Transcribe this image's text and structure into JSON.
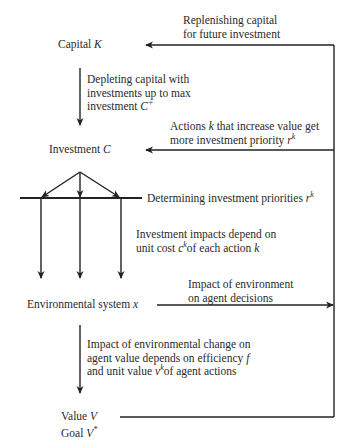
{
  "nodes": {
    "capital": {
      "label": "Capital",
      "symbol": "K"
    },
    "investment": {
      "label": "Investment",
      "symbol": "C"
    },
    "environment": {
      "label": "Environmental system",
      "symbol": "x"
    },
    "value": {
      "label": "Value",
      "symbol": "V"
    },
    "goal": {
      "label": "Goal",
      "symbol": "V",
      "sup": "*"
    }
  },
  "edges": {
    "replenish": {
      "line1": "Replenishing capital",
      "line2": "for future investment"
    },
    "deplete": {
      "line1": "Depleting capital with",
      "line2": "investments up to max",
      "line3_text": "investment",
      "line3_sym": "C",
      "line3_sup": "+"
    },
    "priority": {
      "line1_a": "Actions",
      "line1_sym": "k",
      "line1_b": "that increase value get",
      "line2_text": "more investment priority",
      "line2_sym": "r",
      "line2_sup": "k"
    },
    "determine": {
      "text": "Determining investment priorities",
      "sym": "r",
      "sup": "k"
    },
    "impacts": {
      "line1": "Investment impacts depend on",
      "line2_a": "unit cost",
      "line2_sym": "c",
      "line2_sup": "k",
      "line2_b": "of each action",
      "line2_sym2": "k"
    },
    "env_impact": {
      "line1": "Impact of environment",
      "line2": "on agent decisions"
    },
    "env_change": {
      "line1": "Impact of environmental change on",
      "line2_a": "agent value depends on efficiency",
      "line2_sym": "f",
      "line3_a": "and unit value",
      "line3_sym": "v",
      "line3_sup": "k",
      "line3_b": "of agent actions"
    }
  },
  "colors": {
    "line": "#222222",
    "text": "#2a2a2a",
    "background": "#ffffff"
  }
}
